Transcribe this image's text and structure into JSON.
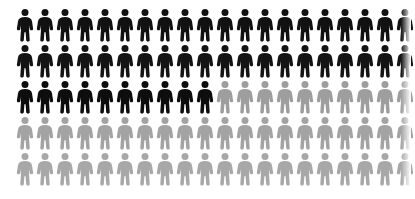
{
  "chart_data": {
    "type": "pictogram",
    "title": "",
    "subtitle": "",
    "xlabel": "",
    "ylabel": "",
    "unit_label": "person",
    "icon": "person-icon",
    "columns": 20,
    "rows": 5,
    "total_icons": 100,
    "fill_direction": "left-to-right, top-to-bottom",
    "grid": false,
    "legend": [],
    "annotations": [],
    "categories": [
      "filled",
      "unfilled"
    ],
    "values": [
      50,
      50
    ],
    "percentages": [
      50,
      50
    ],
    "series": [
      {
        "name": "filled",
        "value": 50,
        "color": "#111111"
      },
      {
        "name": "unfilled",
        "value": 50,
        "color": "#9b9b9b"
      }
    ],
    "colors": {
      "filled": "#111111",
      "unfilled_row3": "#9e9e9e",
      "unfilled_row4": "#a3a3a3",
      "unfilled_row5": "#a8a8a8",
      "background": "#ffffff"
    },
    "row_fill_counts": [
      20,
      20,
      10,
      0,
      0
    ],
    "rows_data": [
      {
        "index": 1,
        "filled": 20,
        "unfilled": 0,
        "fill_color": "#111111",
        "empty_color": "#9e9e9e"
      },
      {
        "index": 2,
        "filled": 20,
        "unfilled": 0,
        "fill_color": "#131313",
        "empty_color": "#9e9e9e"
      },
      {
        "index": 3,
        "filled": 10,
        "unfilled": 10,
        "fill_color": "#0d0d0d",
        "empty_color": "#9e9e9e"
      },
      {
        "index": 4,
        "filled": 0,
        "unfilled": 20,
        "fill_color": "#111111",
        "empty_color": "#a3a3a3"
      },
      {
        "index": 5,
        "filled": 0,
        "unfilled": 20,
        "fill_color": "#111111",
        "empty_color": "#a8a8a8"
      }
    ]
  }
}
